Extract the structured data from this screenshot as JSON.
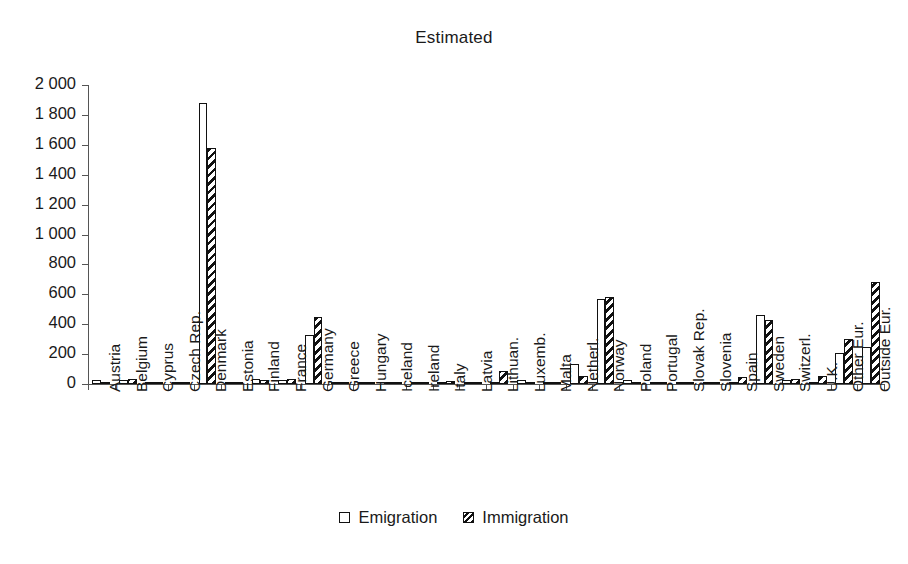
{
  "chart": {
    "title": "Estimated",
    "legend": {
      "position": "bottom",
      "emigration_label": "Emigration",
      "immigration_label": "Immigration",
      "emigration_icon": "empty-square-swatch",
      "immigration_icon": "hatched-square-swatch"
    }
  },
  "chart_data": {
    "type": "bar",
    "title": "Estimated",
    "xlabel": "",
    "ylabel": "",
    "ylim": [
      0,
      2000
    ],
    "ytick_step": 200,
    "grid": false,
    "legend_position": "bottom",
    "categories": [
      "Austria",
      "Belgium",
      "Cyprus",
      "Czech Rep.",
      "Denmark",
      "Estonia",
      "Finland",
      "France",
      "Germany",
      "Greece",
      "Hungary",
      "Iceland",
      "Ireland",
      "Italy",
      "Latvia",
      "Lithuan.",
      "Luxemb.",
      "Malta",
      "Netherl.",
      "Norway",
      "Poland",
      "Portugal",
      "Slovak Rep.",
      "Slovenia",
      "Spain",
      "Sweden",
      "Switzerl.",
      "U.K.",
      "Other Eur.",
      "Outside Eur."
    ],
    "ytick_labels": [
      "0",
      "200",
      "400",
      "600",
      "800",
      "1 000",
      "1 200",
      "1 400",
      "1 600",
      "1 800",
      "2 000"
    ],
    "series": [
      {
        "name": "Emigration",
        "values": [
          25,
          30,
          2,
          5,
          1880,
          5,
          35,
          30,
          325,
          3,
          2,
          3,
          10,
          15,
          8,
          10,
          30,
          2,
          135,
          570,
          25,
          10,
          3,
          1,
          15,
          460,
          25,
          5,
          205,
          250
        ]
      },
      {
        "name": "Immigration",
        "values": [
          10,
          35,
          2,
          8,
          1580,
          5,
          30,
          35,
          450,
          4,
          3,
          5,
          12,
          20,
          10,
          85,
          8,
          2,
          55,
          580,
          12,
          8,
          4,
          1,
          45,
          430,
          35,
          55,
          300,
          683
        ]
      }
    ]
  }
}
